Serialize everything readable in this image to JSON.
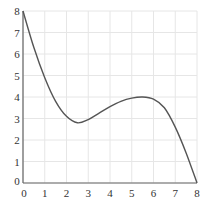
{
  "chart_data": {
    "type": "line",
    "title": "",
    "xlabel": "",
    "ylabel": "",
    "xlim": [
      0,
      8
    ],
    "ylim": [
      0,
      8
    ],
    "grid": true,
    "x_ticks": [
      "0",
      "1",
      "2",
      "3",
      "4",
      "5",
      "6",
      "7",
      "8"
    ],
    "y_ticks": [
      "0",
      "1",
      "2",
      "3",
      "4",
      "5",
      "6",
      "7",
      "8"
    ],
    "series": [
      {
        "name": "f(x)",
        "x": [
          0,
          0.5,
          1,
          1.5,
          2,
          2.5,
          3,
          3.5,
          4,
          4.5,
          5,
          5.5,
          6,
          6.5,
          7,
          7.5,
          8
        ],
        "y": [
          8,
          6.3,
          4.9,
          3.8,
          3.1,
          2.8,
          2.95,
          3.25,
          3.55,
          3.8,
          3.95,
          4.0,
          3.9,
          3.5,
          2.6,
          1.4,
          0
        ]
      }
    ],
    "colors": {
      "line": "#555555",
      "grid": "#e6e6e6",
      "axis": "#666666"
    }
  }
}
